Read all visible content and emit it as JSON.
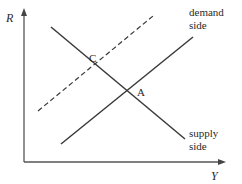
{
  "diagram": {
    "axes": {
      "y_label": "R",
      "x_label": "Y"
    },
    "curves": [
      {
        "id": "supply",
        "label_line1": "supply",
        "label_line2": "side",
        "style": "solid"
      },
      {
        "id": "demand",
        "label_line1": "demand",
        "label_line2": "side",
        "style": "solid"
      },
      {
        "id": "shifted-demand",
        "style": "dashed"
      }
    ],
    "points": [
      {
        "id": "C",
        "label": "C"
      },
      {
        "id": "A",
        "label": "A"
      }
    ],
    "colors": {
      "line": "#3a3a3a",
      "axis": "#555555",
      "text": "#2a2a2a",
      "background": "#ffffff"
    }
  }
}
